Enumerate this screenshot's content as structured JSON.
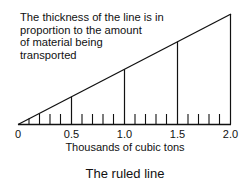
{
  "annotation": {
    "line1": "The thickness of the line is in",
    "line2": "proportion to the amount",
    "line3": "of material being",
    "line4": "transported"
  },
  "axis": {
    "title": "Thousands of cubic tons",
    "tick_labels": [
      "0",
      "0.5",
      "1.0",
      "1.5",
      "2.0"
    ],
    "min": 0,
    "max": 2.0,
    "minor_step": 0.1,
    "major_step": 0.5
  },
  "figure_title": "The ruled line",
  "colors": {
    "line": "#111111",
    "background": "#ffffff"
  }
}
